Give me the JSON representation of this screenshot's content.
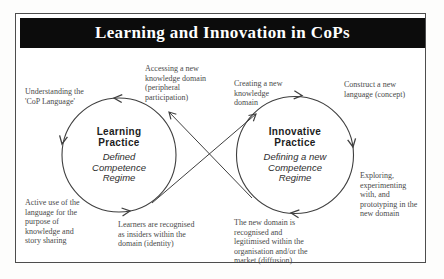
{
  "title": "Learning and Innovation in CoPs",
  "circles": {
    "learning": {
      "name": "Learning\nPractice",
      "regime": "Defined\nCompetence\nRegime"
    },
    "innovative": {
      "name": "Innovative\nPractice",
      "regime": "Defining a new\nCompetence\nRegime"
    }
  },
  "labels": [
    {
      "id": "understanding",
      "text": "Understanding the\n'CoP Language'"
    },
    {
      "id": "accessing",
      "text": "Accessing a new\nknowledge domain\n(peripheral\nparticipation)"
    },
    {
      "id": "creating",
      "text": "Creating a new\nknowledge\ndomain"
    },
    {
      "id": "construct",
      "text": "Construct a new\nlanguage (concept)"
    },
    {
      "id": "exploring",
      "text": "Exploring,\nexperimenting\nwith, and\nprototyping in the\nnew domain"
    },
    {
      "id": "new-domain",
      "text": "The new domain is\nrecognised and\nlegitimised within the\norganisation and/or the\nmarket (diffusion)"
    },
    {
      "id": "learners",
      "text": "Learners are recognised\nas insiders within the\ndomain (identity)"
    },
    {
      "id": "active-use",
      "text": "Active use of the\nlanguage for the\npurpose of\nknowledge and\nstory sharing"
    }
  ],
  "colors": {
    "title_bar_bg": "#0c0c0c",
    "title_text": "#ffffff",
    "stroke": "#3f3f3f",
    "label_text": "#4a4a4a",
    "frame_border": "#4d4d4d",
    "background": "#ffffff"
  }
}
